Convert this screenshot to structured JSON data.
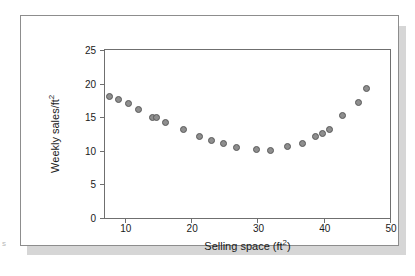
{
  "chart_data": {
    "type": "scatter",
    "title": "",
    "xlabel": "Selling space (ft²)",
    "ylabel": "Weekly sales/ft²",
    "xlim": [
      7,
      50
    ],
    "ylim": [
      0,
      25
    ],
    "xticks": [
      10,
      20,
      30,
      40,
      50
    ],
    "yticks": [
      0,
      5,
      10,
      15,
      20,
      25
    ],
    "xtick_labels": [
      "10",
      "20",
      "30",
      "40",
      "50"
    ],
    "ytick_labels": [
      "0",
      "5",
      "10",
      "15",
      "20",
      "25"
    ],
    "grid": false,
    "legend": null,
    "marker": {
      "shape": "circle",
      "fill_color": "#8e8e8e",
      "edge_color": "#5a5a5a",
      "size_px": 7
    },
    "x": [
      7.7,
      9.0,
      10.6,
      12.0,
      14.1,
      14.7,
      16.2,
      18.9,
      21.2,
      23.1,
      24.9,
      26.9,
      29.8,
      32.0,
      34.6,
      36.8,
      38.8,
      39.8,
      40.9,
      42.8,
      45.3,
      46.5
    ],
    "y": [
      18.1,
      17.6,
      17.0,
      16.1,
      14.9,
      15.0,
      14.2,
      13.2,
      12.1,
      11.5,
      11.1,
      10.5,
      10.2,
      10.1,
      10.6,
      11.1,
      12.2,
      12.6,
      13.2,
      15.2,
      17.2,
      19.2
    ],
    "points": [
      {
        "x": 7.7,
        "y": 18.1
      },
      {
        "x": 9.0,
        "y": 17.6
      },
      {
        "x": 10.6,
        "y": 17.0
      },
      {
        "x": 12.0,
        "y": 16.1
      },
      {
        "x": 14.1,
        "y": 14.9
      },
      {
        "x": 14.7,
        "y": 15.0
      },
      {
        "x": 16.2,
        "y": 14.2
      },
      {
        "x": 18.9,
        "y": 13.2
      },
      {
        "x": 21.2,
        "y": 12.1
      },
      {
        "x": 23.1,
        "y": 11.5
      },
      {
        "x": 24.9,
        "y": 11.1
      },
      {
        "x": 26.9,
        "y": 10.5
      },
      {
        "x": 29.8,
        "y": 10.2
      },
      {
        "x": 32.0,
        "y": 10.1
      },
      {
        "x": 34.6,
        "y": 10.6
      },
      {
        "x": 36.8,
        "y": 11.1
      },
      {
        "x": 38.8,
        "y": 12.2
      },
      {
        "x": 39.8,
        "y": 12.6
      },
      {
        "x": 40.9,
        "y": 13.2
      },
      {
        "x": 42.8,
        "y": 15.2
      },
      {
        "x": 45.3,
        "y": 17.2
      },
      {
        "x": 46.5,
        "y": 19.2
      }
    ]
  },
  "colors": {
    "frame": "#6f6f6f",
    "card_border": "#8d8d8d",
    "shadow": "#d6d6d6",
    "text": "#1a1a1a",
    "background": "#ffffff"
  }
}
